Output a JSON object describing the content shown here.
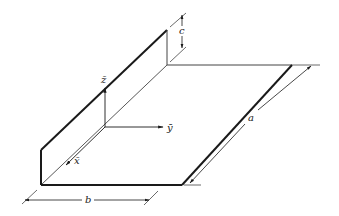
{
  "figure": {
    "type": "isometric-diagram",
    "colors": {
      "background": "#ffffff",
      "outline": "#1a1a1a",
      "thin_line": "#444444",
      "label": "#222222"
    }
  },
  "axes": {
    "z_label": "z̄",
    "y_label": "ȳ",
    "x_label": "x̄"
  },
  "dimensions": {
    "a_label": "a",
    "b_label": "b",
    "c_label": "c"
  }
}
